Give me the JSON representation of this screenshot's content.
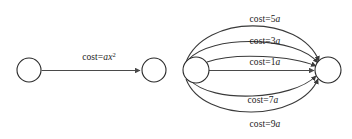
{
  "figure": {
    "background_color": "#ffffff",
    "stroke_color": "#3a3a3a",
    "text_color": "#1a1a1a",
    "width": 352,
    "height": 139
  },
  "diagrams": [
    {
      "id": "single-edge-graph",
      "name": "left-graph",
      "nodes": [
        {
          "id": "L1",
          "name": "source-node",
          "cx": 29,
          "cy": 70,
          "r": 12
        },
        {
          "id": "L2",
          "name": "target-node",
          "cx": 154,
          "cy": 70,
          "r": 12
        }
      ],
      "edges": [
        {
          "id": "L-e1",
          "name": "edge-cost-ax2",
          "label_prefix": "cost=",
          "label_var": "ax",
          "label_sup": "2",
          "label_full": "cost=ax2",
          "label_x": 99,
          "label_y": 60,
          "curvature": 0
        }
      ]
    },
    {
      "id": "multi-edge-graph",
      "name": "right-graph",
      "nodes": [
        {
          "id": "R1",
          "name": "source-node",
          "cx": 196,
          "cy": 70,
          "r": 13
        },
        {
          "id": "R2",
          "name": "target-node",
          "cx": 328,
          "cy": 70,
          "r": 13
        }
      ],
      "edges": [
        {
          "id": "R-e5",
          "name": "edge-cost-5a",
          "label_prefix": "cost=",
          "label_num": "5",
          "label_var": "a",
          "label_full": "cost=5a",
          "label_x": 265,
          "label_y": 22,
          "curvature": -52
        },
        {
          "id": "R-e3",
          "name": "edge-cost-3a",
          "label_prefix": "cost=",
          "label_num": "3",
          "label_var": "a",
          "label_full": "cost=3a",
          "label_x": 265,
          "label_y": 44,
          "curvature": -30
        },
        {
          "id": "R-e1",
          "name": "edge-cost-1a",
          "label_prefix": "cost=",
          "label_num": "1",
          "label_var": "a",
          "label_full": "cost=1a",
          "label_x": 265,
          "label_y": 65,
          "curvature": -11
        },
        {
          "id": "R-e7",
          "name": "edge-cost-7a",
          "label_prefix": "cost=",
          "label_num": "7",
          "label_var": "a",
          "label_full": "cost=7a",
          "label_x": 263,
          "label_y": 103,
          "curvature": 27
        },
        {
          "id": "R-e9",
          "name": "edge-cost-9a",
          "label_prefix": "cost=",
          "label_num": "9",
          "label_var": "a",
          "label_full": "cost=9a",
          "label_x": 265,
          "label_y": 127,
          "curvature": 48
        }
      ],
      "straight_edge": {
        "id": "R-e0",
        "name": "edge-straight-baseline"
      }
    }
  ]
}
